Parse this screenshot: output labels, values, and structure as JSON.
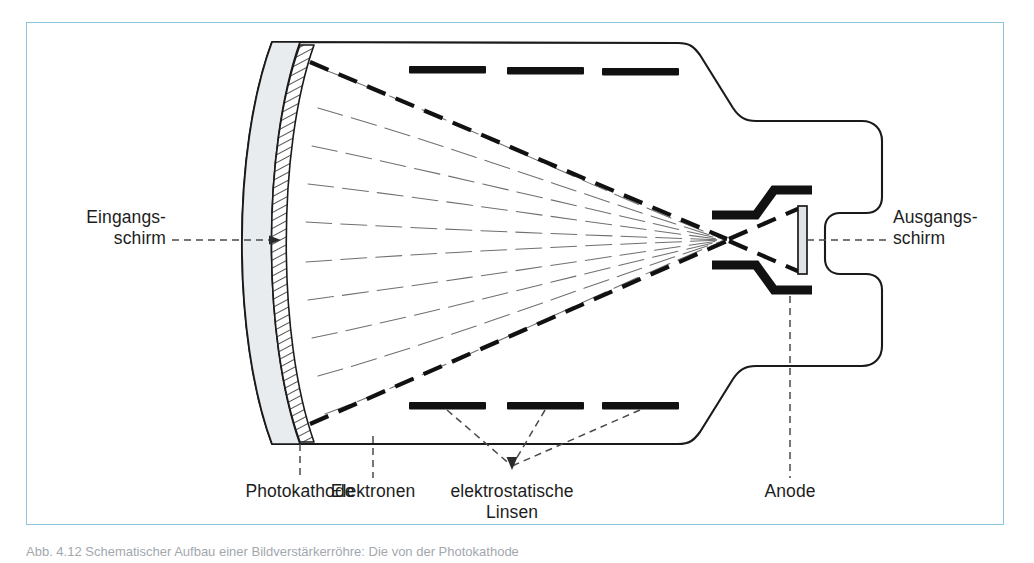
{
  "figure": {
    "frame_color": "#8cc5dd",
    "background_color": "#ffffff",
    "ink_color": "#1a1a1a"
  },
  "labels": {
    "entrance_screen": "Eingangs-\nschirm",
    "exit_screen": "Ausgangs-\nschirm",
    "photocathode": "Photokathode",
    "electrons": "Elektronen",
    "electrostatic_lenses": "elektrostatische\nLinsen",
    "anode": "Anode"
  },
  "components": {
    "entrance_screen_fill": "#e8ecef",
    "photocathode_hatch": "#1a1a1a",
    "electrode_color": "#111111",
    "exit_screen_fill": "#dfe3e6",
    "trajectory_color": "#707070",
    "beam_envelope_color": "#111111",
    "leader_color": "#4a4a4a",
    "electrode_bar_count_top": 3,
    "electrode_bar_count_bottom": 3
  },
  "caption": {
    "text": "Abb. 4.12   Schematischer Aufbau einer Bildverstärkerröhre: Die von der Photokathode"
  }
}
